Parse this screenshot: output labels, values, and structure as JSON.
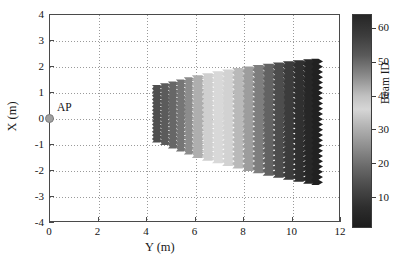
{
  "figure": {
    "background": "#ffffff",
    "axis_color": "#4a4a4a",
    "grid_color": "#9a9a9a"
  },
  "axes": {
    "x": {
      "label": "Y (m)",
      "min": 0,
      "max": 12,
      "ticks": [
        0,
        2,
        4,
        6,
        8,
        10,
        12
      ],
      "tick_labels": [
        "0",
        "2",
        "4",
        "6",
        "8",
        "10",
        "12"
      ]
    },
    "y": {
      "label": "X (m)",
      "min": -4,
      "max": 4,
      "ticks": [
        -4,
        -3,
        -2,
        -1,
        0,
        1,
        2,
        3,
        4
      ],
      "tick_labels": [
        "-4",
        "-3",
        "-2",
        "-1",
        "0",
        "1",
        "2",
        "3",
        "4"
      ]
    },
    "grid": true
  },
  "annotations": {
    "ap": {
      "label": "AP",
      "x": 0,
      "y": 0,
      "marker_color": "#a0a0a0",
      "marker_edge_color": "#7d7d7d"
    }
  },
  "colorbar": {
    "title": "Beam ID",
    "min": 1,
    "max": 64,
    "ticks": [
      10,
      20,
      30,
      40,
      50,
      60
    ],
    "tick_labels": [
      "10",
      "20",
      "30",
      "40",
      "50",
      "60"
    ],
    "colormap_name": "jet-grayscale",
    "stops": [
      {
        "value": 64,
        "color": "#262626"
      },
      {
        "value": 58,
        "color": "#3c3c3c"
      },
      {
        "value": 52,
        "color": "#5a5a5a"
      },
      {
        "value": 46,
        "color": "#8a8a8a"
      },
      {
        "value": 40,
        "color": "#c0c0c0"
      },
      {
        "value": 36,
        "color": "#d6d6d6"
      },
      {
        "value": 31,
        "color": "#b4b4b4"
      },
      {
        "value": 25,
        "color": "#8f8f8f"
      },
      {
        "value": 19,
        "color": "#6a6a6a"
      },
      {
        "value": 13,
        "color": "#4a4a4a"
      },
      {
        "value": 7,
        "color": "#2e2e2e"
      },
      {
        "value": 1,
        "color": "#1c1c1c"
      }
    ]
  },
  "chart_data": {
    "type": "scatter",
    "title": "",
    "xlabel": "Y (m)",
    "ylabel": "X (m)",
    "xlim": [
      0,
      12
    ],
    "ylim": [
      -4,
      4
    ],
    "zlabel": "Beam ID",
    "zlim": [
      1,
      64
    ],
    "grid": true,
    "legend": null,
    "columns": [
      {
        "beam_id": 14,
        "y_center": 4.4,
        "y_width": 0.33,
        "x_min": -0.95,
        "x_max": 1.28,
        "teeth": 16,
        "color": "#4f4f4f"
      },
      {
        "beam_id": 16,
        "y_center": 4.73,
        "y_width": 0.33,
        "x_min": -1.05,
        "x_max": 1.35,
        "teeth": 17,
        "color": "#5b5b5b"
      },
      {
        "beam_id": 19,
        "y_center": 5.06,
        "y_width": 0.33,
        "x_min": -1.18,
        "x_max": 1.42,
        "teeth": 17,
        "color": "#676767"
      },
      {
        "beam_id": 22,
        "y_center": 5.39,
        "y_width": 0.33,
        "x_min": -1.3,
        "x_max": 1.5,
        "teeth": 18,
        "color": "#767676"
      },
      {
        "beam_id": 26,
        "y_center": 5.72,
        "y_width": 0.33,
        "x_min": -1.42,
        "x_max": 1.58,
        "teeth": 18,
        "color": "#8c8c8c"
      },
      {
        "beam_id": 31,
        "y_center": 6.1,
        "y_width": 0.42,
        "x_min": -1.55,
        "x_max": 1.66,
        "teeth": 19,
        "color": "#aeaeae"
      },
      {
        "beam_id": 35,
        "y_center": 6.52,
        "y_width": 0.42,
        "x_min": -1.66,
        "x_max": 1.74,
        "teeth": 19,
        "color": "#cfcfcf"
      },
      {
        "beam_id": 37,
        "y_center": 6.94,
        "y_width": 0.42,
        "x_min": -1.76,
        "x_max": 1.82,
        "teeth": 20,
        "color": "#d8d8d8"
      },
      {
        "beam_id": 38,
        "y_center": 7.36,
        "y_width": 0.42,
        "x_min": -1.86,
        "x_max": 1.88,
        "teeth": 20,
        "color": "#d2d2d2"
      },
      {
        "beam_id": 41,
        "y_center": 7.78,
        "y_width": 0.42,
        "x_min": -1.96,
        "x_max": 1.94,
        "teeth": 21,
        "color": "#b9b9b9"
      },
      {
        "beam_id": 44,
        "y_center": 8.2,
        "y_width": 0.42,
        "x_min": -2.06,
        "x_max": 2.0,
        "teeth": 21,
        "color": "#9d9d9d"
      },
      {
        "beam_id": 47,
        "y_center": 8.62,
        "y_width": 0.42,
        "x_min": -2.15,
        "x_max": 2.06,
        "teeth": 22,
        "color": "#7e7e7e"
      },
      {
        "beam_id": 50,
        "y_center": 9.04,
        "y_width": 0.42,
        "x_min": -2.24,
        "x_max": 2.11,
        "teeth": 22,
        "color": "#636363"
      },
      {
        "beam_id": 53,
        "y_center": 9.46,
        "y_width": 0.42,
        "x_min": -2.32,
        "x_max": 2.16,
        "teeth": 23,
        "color": "#4d4d4d"
      },
      {
        "beam_id": 56,
        "y_center": 9.88,
        "y_width": 0.42,
        "x_min": -2.4,
        "x_max": 2.2,
        "teeth": 23,
        "color": "#3c3c3c"
      },
      {
        "beam_id": 59,
        "y_center": 10.3,
        "y_width": 0.42,
        "x_min": -2.48,
        "x_max": 2.24,
        "teeth": 24,
        "color": "#303030"
      },
      {
        "beam_id": 62,
        "y_center": 10.72,
        "y_width": 0.42,
        "x_min": -2.55,
        "x_max": 2.28,
        "teeth": 24,
        "color": "#272727"
      },
      {
        "beam_id": 64,
        "y_center": 11.0,
        "y_width": 0.3,
        "x_min": -2.6,
        "x_max": 2.3,
        "teeth": 24,
        "color": "#212121"
      }
    ]
  }
}
